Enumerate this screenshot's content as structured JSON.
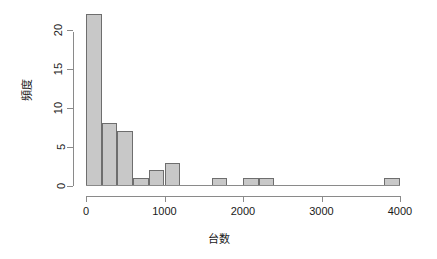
{
  "chart_data": {
    "type": "bar",
    "title": "",
    "subtitle": "",
    "xlabel": "台数",
    "ylabel": "頻度",
    "xlim": [
      0,
      4000
    ],
    "ylim": [
      0,
      22
    ],
    "grid": false,
    "legend": null,
    "bin_width": 200,
    "categories": [
      "0-200",
      "200-400",
      "400-600",
      "600-800",
      "800-1000",
      "1000-1200",
      "1600-1800",
      "2000-2200",
      "2200-2400",
      "3800-4000"
    ],
    "bin_starts": [
      0,
      200,
      400,
      600,
      800,
      1000,
      1600,
      2000,
      2200,
      3800
    ],
    "values": [
      22,
      8,
      7,
      1,
      2,
      3,
      1,
      1,
      1,
      1
    ],
    "x_ticks": [
      0,
      1000,
      2000,
      3000,
      4000
    ],
    "x_tick_labels": [
      "0",
      "1000",
      "2000",
      "3000",
      "4000"
    ],
    "y_ticks": [
      0,
      5,
      10,
      15,
      20
    ],
    "y_tick_labels": [
      "0",
      "5",
      "10",
      "15",
      "20"
    ],
    "bar_fill_color": "#c8c8c8",
    "bar_border_color": "#6e6e6e",
    "axis_color": "#8a8a8a",
    "text_color": "#1a1a1a",
    "background_color": "#ffffff"
  }
}
